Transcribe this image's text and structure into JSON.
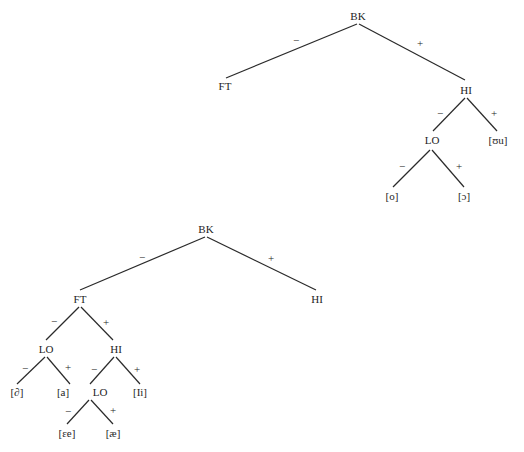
{
  "trees": [
    {
      "name": "back-vowels-tree",
      "nodes": {
        "root": "BK",
        "ft": "FT",
        "hi": "HI",
        "lo": "LO",
        "uu": "[ʊu]",
        "o": "[o]",
        "open_o": "[ɔ]"
      },
      "signs": {
        "bk_minus": "−",
        "bk_plus": "+",
        "hi_minus": "−",
        "hi_plus": "+",
        "lo_minus": "−",
        "lo_plus": "+"
      }
    },
    {
      "name": "front-vowels-tree",
      "nodes": {
        "root": "BK",
        "ft": "FT",
        "hi_right": "HI",
        "lo1": "LO",
        "hi": "HI",
        "schwa": "[∂]",
        "a": "[a]",
        "lo2": "LO",
        "ii": "[Ii]",
        "ee": "[ɛe]",
        "ae": "[æ]"
      },
      "signs": {
        "bk_minus": "−",
        "bk_plus": "+",
        "ft_minus": "−",
        "ft_plus": "+",
        "lo1_minus": "−",
        "lo1_plus": "+",
        "hi_minus": "−",
        "hi_plus": "+",
        "lo2_minus": "−",
        "lo2_plus": "+"
      }
    }
  ]
}
